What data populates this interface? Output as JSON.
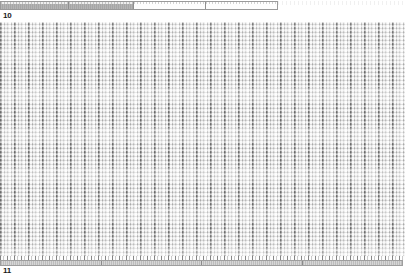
{
  "document": {
    "page_break_top_label": "10",
    "page_break_bottom_label": "11"
  },
  "top_ruler": {
    "name": "segmented-progress-ruler",
    "total_width_px": 278,
    "segments": [
      {
        "label": "",
        "state": "filled",
        "width_px": 68
      },
      {
        "label": "",
        "state": "filled",
        "width_px": 66
      },
      {
        "label": "",
        "state": "empty",
        "width_px": 72
      },
      {
        "label": "",
        "state": "empty",
        "width_px": 72
      }
    ],
    "filled_color": "#aeaeae",
    "empty_color": "#fdfdfd",
    "border_color": "#9a9a9a"
  },
  "bottom_ruler": {
    "name": "segmented-footer-ruler",
    "total_width_px": 403,
    "segments": [
      {
        "label": "",
        "state": "filled",
        "width_px": 101
      },
      {
        "label": "",
        "state": "filled",
        "width_px": 101
      },
      {
        "label": "",
        "state": "filled",
        "width_px": 101
      },
      {
        "label": "",
        "state": "filled",
        "width_px": 100
      }
    ],
    "fill_color": "#c6c6c6",
    "border_color": "#9e9e9e"
  },
  "content_grid": {
    "name": "dense-column-data-grid",
    "description": "Dense grayscale grid of narrow vertical columns with fine horizontal row texture",
    "column_period_px": 7,
    "group_period_px": 14,
    "row_period_px": 4,
    "background_color": "#f3f3f3",
    "stripe_dark_color": "#8e8e8e",
    "stripe_mid_color": "#bdbdbd",
    "stripe_light_color": "#f6f6f6",
    "approx_columns": 58,
    "approx_rows": 60
  },
  "colors": {
    "page_background": "#ffffff",
    "text": "#1a1a1a"
  }
}
